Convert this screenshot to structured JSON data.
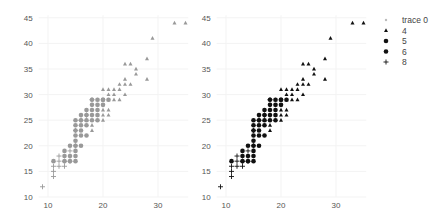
{
  "chart_data": [
    {
      "type": "scatter",
      "panel": "left",
      "title": "",
      "xlabel": "",
      "ylabel": "",
      "xlim": [
        8.3,
        35.5
      ],
      "ylim": [
        10,
        45.5
      ],
      "x_ticks": [
        10,
        20,
        30
      ],
      "y_ticks": [
        10,
        15,
        20,
        25,
        30,
        35,
        40,
        45
      ],
      "grid": true,
      "color": "#999999",
      "series": [
        {
          "name": "4",
          "marker": "triangle",
          "points": [
            [
              18,
              23
            ],
            [
              18,
              24
            ],
            [
              19,
              26
            ],
            [
              20,
              25
            ],
            [
              20,
              26
            ],
            [
              20,
              27
            ],
            [
              20,
              28
            ],
            [
              20,
              31
            ],
            [
              21,
              26
            ],
            [
              21,
              27
            ],
            [
              21,
              29
            ],
            [
              21,
              30
            ],
            [
              21,
              31
            ],
            [
              22,
              29
            ],
            [
              22,
              30
            ],
            [
              22,
              31
            ],
            [
              23,
              29
            ],
            [
              23,
              31
            ],
            [
              23,
              32
            ],
            [
              24,
              30
            ],
            [
              24,
              32
            ],
            [
              24,
              33
            ],
            [
              24,
              36
            ],
            [
              25,
              32
            ],
            [
              25,
              36
            ],
            [
              26,
              34
            ],
            [
              26,
              35
            ],
            [
              28,
              33
            ],
            [
              28,
              37
            ],
            [
              29,
              41
            ],
            [
              33,
              44
            ],
            [
              35,
              44
            ],
            [
              19,
              28
            ],
            [
              19,
              29
            ],
            [
              17,
              25
            ]
          ]
        },
        {
          "name": "5",
          "marker": "circle",
          "points": [
            [
              20,
              28
            ],
            [
              20,
              29
            ],
            [
              21,
              29
            ]
          ]
        },
        {
          "name": "6",
          "marker": "circle",
          "points": [
            [
              11,
              17
            ],
            [
              13,
              17
            ],
            [
              13,
              18
            ],
            [
              13,
              19
            ],
            [
              14,
              17
            ],
            [
              14,
              18
            ],
            [
              14,
              20
            ],
            [
              15,
              17
            ],
            [
              15,
              18
            ],
            [
              15,
              19
            ],
            [
              15,
              20
            ],
            [
              15,
              21
            ],
            [
              15,
              22
            ],
            [
              15,
              23
            ],
            [
              15,
              24
            ],
            [
              15,
              25
            ],
            [
              16,
              20
            ],
            [
              16,
              22
            ],
            [
              16,
              23
            ],
            [
              16,
              24
            ],
            [
              16,
              25
            ],
            [
              16,
              26
            ],
            [
              17,
              22
            ],
            [
              17,
              24
            ],
            [
              17,
              25
            ],
            [
              17,
              26
            ],
            [
              17,
              27
            ],
            [
              18,
              25
            ],
            [
              18,
              26
            ],
            [
              18,
              27
            ],
            [
              18,
              28
            ],
            [
              18,
              29
            ],
            [
              19,
              25
            ],
            [
              19,
              26
            ],
            [
              19,
              27
            ],
            [
              19,
              28
            ],
            [
              19,
              29
            ],
            [
              20,
              29
            ]
          ]
        },
        {
          "name": "8",
          "marker": "cross",
          "points": [
            [
              9,
              12
            ],
            [
              11,
              14
            ],
            [
              11,
              15
            ],
            [
              11,
              16
            ],
            [
              12,
              16
            ],
            [
              12,
              17
            ],
            [
              12,
              18
            ],
            [
              13,
              16
            ],
            [
              13,
              17
            ],
            [
              14,
              19
            ],
            [
              14,
              17
            ],
            [
              15,
              20
            ],
            [
              15,
              23
            ],
            [
              16,
              25
            ],
            [
              17,
              26
            ],
            [
              18,
              29
            ]
          ]
        }
      ]
    },
    {
      "type": "scatter",
      "panel": "right",
      "title": "",
      "xlabel": "",
      "ylabel": "",
      "xlim": [
        8.3,
        35.5
      ],
      "ylim": [
        10,
        45.5
      ],
      "x_ticks": [
        10,
        20,
        30
      ],
      "y_ticks": [
        10,
        15,
        20,
        25,
        30,
        35,
        40,
        45
      ],
      "grid": true,
      "legend_position": "right",
      "legend": [
        "trace 0",
        "4",
        "5",
        "6",
        "8"
      ],
      "colors": {
        "trace 0": "#bbbbbb",
        "4": "#111111",
        "5": "#111111",
        "6": "#111111",
        "8": "#111111"
      },
      "series_ref": "same points as left panel, drawn in black with per-cyl markers"
    }
  ],
  "panels": {
    "left": {
      "x0": 48,
      "x_per_unit": 5.5,
      "y0": 197,
      "y_per_unit": 5.12,
      "x_tick_base": 10,
      "y_tick_base": 10
    },
    "right": {
      "x0": 226,
      "x_per_unit": 5.5,
      "y0": 197,
      "y_per_unit": 5.12,
      "x_tick_base": 10,
      "y_tick_base": 10
    }
  },
  "legend": {
    "items": [
      {
        "label": "trace 0",
        "marker": "dot-small",
        "color": "#bbbbbb"
      },
      {
        "label": "4",
        "marker": "triangle",
        "color": "#111111"
      },
      {
        "label": "5",
        "marker": "circle",
        "color": "#111111"
      },
      {
        "label": "6",
        "marker": "circle",
        "color": "#111111"
      },
      {
        "label": "8",
        "marker": "cross",
        "color": "#111111"
      }
    ]
  }
}
